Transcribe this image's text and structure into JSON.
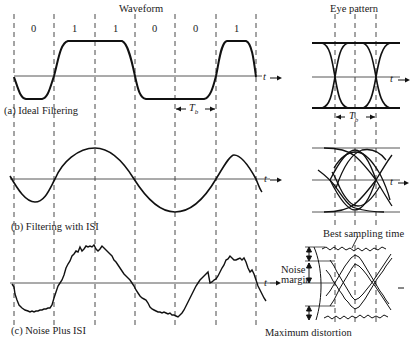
{
  "headers": {
    "waveform": "Waveform",
    "eye_pattern": "Eye pattern"
  },
  "bits": [
    "0",
    "1",
    "1",
    "0",
    "0",
    "1"
  ],
  "panels": {
    "a": {
      "caption": "(a) Ideal Filtering"
    },
    "b": {
      "caption": "(b) Filtering with ISI"
    },
    "c": {
      "caption": "(c) Noise Plus ISI"
    }
  },
  "axis": {
    "time_label": "t"
  },
  "annotations": {
    "bit_period": "T",
    "bit_period_sub": "b",
    "best_sampling_time": "Best sampling time",
    "noise_margin_line1": "Noise",
    "noise_margin_line2": "margin",
    "maximum_distortion": "Maximum distortion"
  },
  "colors": {
    "ink": "#1a1a1a",
    "background": "#ffffff"
  }
}
